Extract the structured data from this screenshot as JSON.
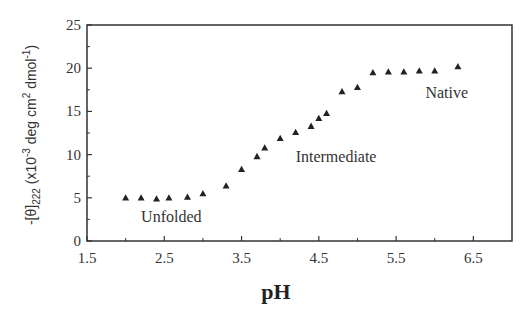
{
  "chart_data": {
    "type": "scatter",
    "title": "",
    "xlabel": "pH",
    "ylabel": "-[θ]222 (x10-3 deg cm2 dmol-1)",
    "ylabel_parts": {
      "prefix": "-[θ]",
      "subscript": "222",
      "units_open": " (x10",
      "units_exp1": "-3",
      "units_mid": " deg cm",
      "units_exp2": "2",
      "units_mid2": " dmol",
      "units_exp3": "-1",
      "units_close": ")"
    },
    "xlim": [
      1.5,
      7.0
    ],
    "ylim": [
      0,
      25
    ],
    "xticks": [
      1.5,
      2.5,
      3.5,
      4.5,
      5.5,
      6.5
    ],
    "xtick_labels": [
      "1.5",
      "2.5",
      "3.5",
      "4.5",
      "5.5",
      "6.5"
    ],
    "xminor_ticks": [
      2.0,
      3.0,
      4.0,
      5.0,
      6.0
    ],
    "yticks": [
      0,
      5,
      10,
      15,
      20,
      25
    ],
    "ytick_labels": [
      "0",
      "5",
      "10",
      "15",
      "20",
      "25"
    ],
    "yminor_ticks": [
      2.5,
      7.5,
      12.5,
      17.5,
      22.5
    ],
    "grid": false,
    "legend": null,
    "marker": "triangle",
    "marker_color": "#222222",
    "series": [
      {
        "name": "CD signal",
        "x": [
          2.0,
          2.2,
          2.4,
          2.56,
          2.8,
          3.0,
          3.3,
          3.5,
          3.7,
          3.8,
          4.0,
          4.2,
          4.4,
          4.5,
          4.6,
          4.8,
          5.0,
          5.2,
          5.4,
          5.6,
          5.8,
          6.0,
          6.3
        ],
        "y": [
          5.0,
          5.0,
          4.9,
          5.0,
          5.1,
          5.5,
          6.4,
          8.3,
          9.8,
          10.8,
          11.9,
          12.6,
          13.3,
          14.2,
          14.8,
          17.3,
          17.8,
          19.5,
          19.6,
          19.6,
          19.7,
          19.7,
          20.2
        ]
      }
    ],
    "annotations": [
      {
        "text": "Unfolded",
        "x": 2.2,
        "y": 2.2
      },
      {
        "text": "Intermediate",
        "x": 4.2,
        "y": 9.2
      },
      {
        "text": "Native",
        "x": 5.88,
        "y": 16.6
      }
    ]
  }
}
